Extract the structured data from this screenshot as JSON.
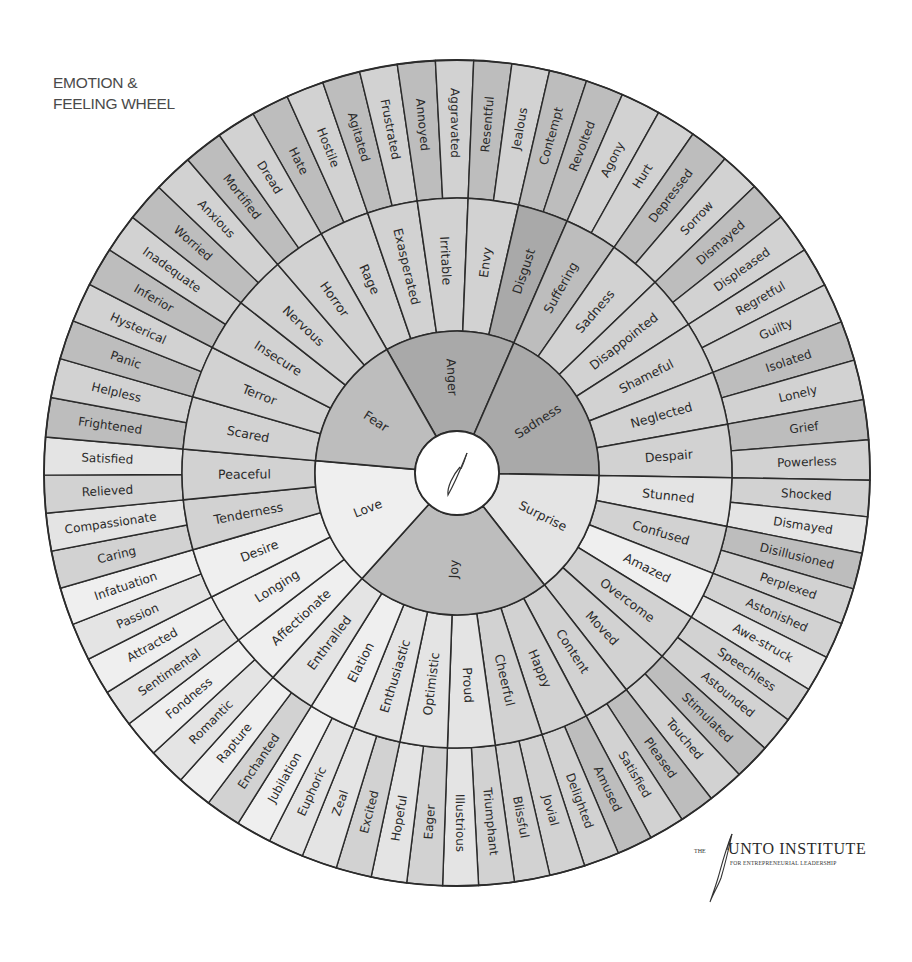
{
  "title": {
    "line1": "EMOTION &",
    "line2": "FEELING WHEEL"
  },
  "logo": {
    "prefix": "THE",
    "name": "UNTO INSTITUTE",
    "tagline": "FOR ENTREPRENEURIAL LEADERSHIP"
  },
  "wheel": {
    "center": [
      457,
      473
    ],
    "radii": {
      "hub": 42,
      "core": 142,
      "middle": 275,
      "outer": 413
    },
    "tones": {
      "dark": "#a9a9a9",
      "mid": "#bdbdbd",
      "light": "#d2d2d2",
      "pale": "#e4e4e4",
      "white": "#efefef",
      "line": "#2b2b2b"
    },
    "core_emotions": [
      {
        "label": "Anger",
        "start": 330.4,
        "end": 383.6,
        "tone": "dark",
        "middle": [
          {
            "label": "Rage",
            "tone": "light",
            "outer": [
              {
                "label": "Hate",
                "tone": "mid"
              },
              {
                "label": "Hostile",
                "tone": "light"
              }
            ]
          },
          {
            "label": "Exasperated",
            "tone": "light",
            "outer": [
              {
                "label": "Agitated",
                "tone": "mid"
              },
              {
                "label": "Frustrated",
                "tone": "light"
              }
            ]
          },
          {
            "label": "Irritable",
            "tone": "light",
            "outer": [
              {
                "label": "Annoyed",
                "tone": "mid"
              },
              {
                "label": "Aggravated",
                "tone": "light"
              }
            ]
          },
          {
            "label": "Envy",
            "tone": "light",
            "outer": [
              {
                "label": "Resentful",
                "tone": "mid"
              },
              {
                "label": "Jealous",
                "tone": "light"
              }
            ]
          },
          {
            "label": "Disgust",
            "tone": "dark",
            "outer": [
              {
                "label": "Contempt",
                "tone": "mid"
              },
              {
                "label": "Revolted",
                "tone": "mid"
              }
            ]
          }
        ]
      },
      {
        "label": "Sadness",
        "start": 23.6,
        "end": 91.0,
        "tone": "dark",
        "middle": [
          {
            "label": "Suffering",
            "tone": "mid",
            "outer": [
              {
                "label": "Agony",
                "tone": "light"
              },
              {
                "label": "Hurt",
                "tone": "light"
              }
            ]
          },
          {
            "label": "Sadness",
            "tone": "light",
            "outer": [
              {
                "label": "Depressed",
                "tone": "mid"
              },
              {
                "label": "Sorrow",
                "tone": "light"
              }
            ]
          },
          {
            "label": "Disappointed",
            "tone": "light",
            "outer": [
              {
                "label": "Dismayed",
                "tone": "mid"
              },
              {
                "label": "Displeased",
                "tone": "light"
              }
            ]
          },
          {
            "label": "Shameful",
            "tone": "light",
            "outer": [
              {
                "label": "Regretful",
                "tone": "light"
              },
              {
                "label": "Guilty",
                "tone": "light"
              }
            ]
          },
          {
            "label": "Neglected",
            "tone": "light",
            "outer": [
              {
                "label": "Isolated",
                "tone": "mid"
              },
              {
                "label": "Lonely",
                "tone": "light"
              }
            ]
          },
          {
            "label": "Despair",
            "tone": "light",
            "outer": [
              {
                "label": "Grief",
                "tone": "mid"
              },
              {
                "label": "Powerless",
                "tone": "light"
              }
            ]
          }
        ]
      },
      {
        "label": "Surprise",
        "start": 91.0,
        "end": 142.0,
        "tone": "pale",
        "middle": [
          {
            "label": "Stunned",
            "tone": "pale",
            "outer": [
              {
                "label": "Shocked",
                "tone": "light"
              },
              {
                "label": "Dismayed",
                "tone": "pale"
              }
            ]
          },
          {
            "label": "Confused",
            "tone": "light",
            "outer": [
              {
                "label": "Disillusioned",
                "tone": "mid"
              },
              {
                "label": "Perplexed",
                "tone": "light"
              }
            ]
          },
          {
            "label": "Amazed",
            "tone": "white",
            "outer": [
              {
                "label": "Astonished",
                "tone": "light"
              },
              {
                "label": "Awe-struck",
                "tone": "pale"
              }
            ]
          },
          {
            "label": "Overcome",
            "tone": "light",
            "outer": [
              {
                "label": "Speechless",
                "tone": "light"
              },
              {
                "label": "Astounded",
                "tone": "light"
              }
            ]
          },
          {
            "label": "Moved",
            "tone": "light",
            "outer": [
              {
                "label": "Stimulated",
                "tone": "mid"
              },
              {
                "label": "Touched",
                "tone": "light"
              }
            ]
          }
        ]
      },
      {
        "label": "Joy",
        "start": 142.0,
        "end": 222.0,
        "tone": "mid",
        "middle": [
          {
            "label": "Content",
            "tone": "light",
            "outer": [
              {
                "label": "Pleased",
                "tone": "mid"
              },
              {
                "label": "Satisfied",
                "tone": "light"
              }
            ]
          },
          {
            "label": "Happy",
            "tone": "light",
            "outer": [
              {
                "label": "Amused",
                "tone": "mid"
              },
              {
                "label": "Delighted",
                "tone": "light"
              }
            ]
          },
          {
            "label": "Cheerful",
            "tone": "light",
            "outer": [
              {
                "label": "Jovial",
                "tone": "light"
              },
              {
                "label": "Blissful",
                "tone": "light"
              }
            ]
          },
          {
            "label": "Proud",
            "tone": "pale",
            "outer": [
              {
                "label": "Triumphant",
                "tone": "light"
              },
              {
                "label": "Illustrious",
                "tone": "pale"
              }
            ]
          },
          {
            "label": "Optimistic",
            "tone": "pale",
            "outer": [
              {
                "label": "Eager",
                "tone": "light"
              },
              {
                "label": "Hopeful",
                "tone": "pale"
              }
            ]
          },
          {
            "label": "Enthusiastic",
            "tone": "pale",
            "outer": [
              {
                "label": "Excited",
                "tone": "light"
              },
              {
                "label": "Zeal",
                "tone": "pale"
              }
            ]
          },
          {
            "label": "Elation",
            "tone": "white",
            "outer": [
              {
                "label": "Euphoric",
                "tone": "pale"
              },
              {
                "label": "Jubilation",
                "tone": "white"
              }
            ]
          },
          {
            "label": "Enthralled",
            "tone": "pale",
            "outer": [
              {
                "label": "Enchanted",
                "tone": "light"
              },
              {
                "label": "Rapture",
                "tone": "white"
              }
            ]
          }
        ]
      },
      {
        "label": "Love",
        "start": 222.0,
        "end": 275.0,
        "tone": "white",
        "middle": [
          {
            "label": "Affectionate",
            "tone": "white",
            "outer": [
              {
                "label": "Romantic",
                "tone": "pale"
              },
              {
                "label": "Fondness",
                "tone": "white"
              }
            ]
          },
          {
            "label": "Longing",
            "tone": "white",
            "outer": [
              {
                "label": "Sentimental",
                "tone": "pale"
              },
              {
                "label": "Attracted",
                "tone": "white"
              }
            ]
          },
          {
            "label": "Desire",
            "tone": "white",
            "outer": [
              {
                "label": "Passion",
                "tone": "pale"
              },
              {
                "label": "Infatuation",
                "tone": "white"
              }
            ]
          },
          {
            "label": "Tenderness",
            "tone": "light",
            "outer": [
              {
                "label": "Caring",
                "tone": "light"
              },
              {
                "label": "Compassionate",
                "tone": "pale"
              }
            ]
          },
          {
            "label": "Peaceful",
            "tone": "light",
            "outer": [
              {
                "label": "Relieved",
                "tone": "light"
              },
              {
                "label": "Satisfied",
                "tone": "pale"
              }
            ]
          }
        ]
      },
      {
        "label": "Fear",
        "start": 275.0,
        "end": 330.4,
        "tone": "mid",
        "middle": [
          {
            "label": "Scared",
            "tone": "light",
            "outer": [
              {
                "label": "Frightened",
                "tone": "mid"
              },
              {
                "label": "Helpless",
                "tone": "light"
              }
            ]
          },
          {
            "label": "Terror",
            "tone": "light",
            "outer": [
              {
                "label": "Panic",
                "tone": "mid"
              },
              {
                "label": "Hysterical",
                "tone": "light"
              }
            ]
          },
          {
            "label": "Insecure",
            "tone": "light",
            "outer": [
              {
                "label": "Inferior",
                "tone": "mid"
              },
              {
                "label": "Inadequate",
                "tone": "light"
              }
            ]
          },
          {
            "label": "Nervous",
            "tone": "light",
            "outer": [
              {
                "label": "Worried",
                "tone": "mid"
              },
              {
                "label": "Anxious",
                "tone": "light"
              }
            ]
          },
          {
            "label": "Horror",
            "tone": "light",
            "outer": [
              {
                "label": "Mortified",
                "tone": "mid"
              },
              {
                "label": "Dread",
                "tone": "light"
              }
            ]
          }
        ]
      }
    ]
  }
}
